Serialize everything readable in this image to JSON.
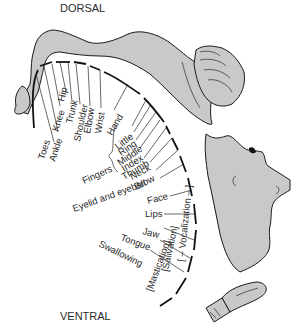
{
  "diagram": {
    "title_top": "DORSAL",
    "title_bottom": "VENTRAL",
    "fill_color": "#c9c9c9",
    "stroke_color": "#1a1a1a",
    "body_parts": [
      {
        "id": "toes",
        "label": "Toes"
      },
      {
        "id": "ankle",
        "label": "Ankle"
      },
      {
        "id": "knee",
        "label": "Knee"
      },
      {
        "id": "hip",
        "label": "Hip"
      },
      {
        "id": "trunk",
        "label": "Trunk"
      },
      {
        "id": "shoulder",
        "label": "Shoulder"
      },
      {
        "id": "elbow",
        "label": "Elbow"
      },
      {
        "id": "wrist",
        "label": "Wrist"
      },
      {
        "id": "hand",
        "label": "Hand"
      },
      {
        "id": "little",
        "label": "Little"
      },
      {
        "id": "ring",
        "label": "Ring"
      },
      {
        "id": "middle",
        "label": "Middle"
      },
      {
        "id": "index",
        "label": "Index"
      },
      {
        "id": "thumb",
        "label": "Thumb"
      },
      {
        "id": "neck",
        "label": "Neck"
      },
      {
        "id": "brow",
        "label": "Brow"
      },
      {
        "id": "eyelid",
        "label": "Eyelid and eyeball"
      },
      {
        "id": "face",
        "label": "Face"
      },
      {
        "id": "lips",
        "label": "Lips"
      },
      {
        "id": "jaw",
        "label": "Jaw"
      },
      {
        "id": "tongue",
        "label": "Tongue"
      },
      {
        "id": "swallowing",
        "label": "Swallowing"
      }
    ],
    "group_label": "Fingers",
    "bracket_labels": {
      "vocalization": "[ – Vocalization – ]",
      "salivation": "[Salivation]",
      "mastication": "[Mastication]"
    },
    "figures": [
      "leg-figure",
      "hand-figure",
      "face-figure",
      "tongue-figure"
    ]
  }
}
